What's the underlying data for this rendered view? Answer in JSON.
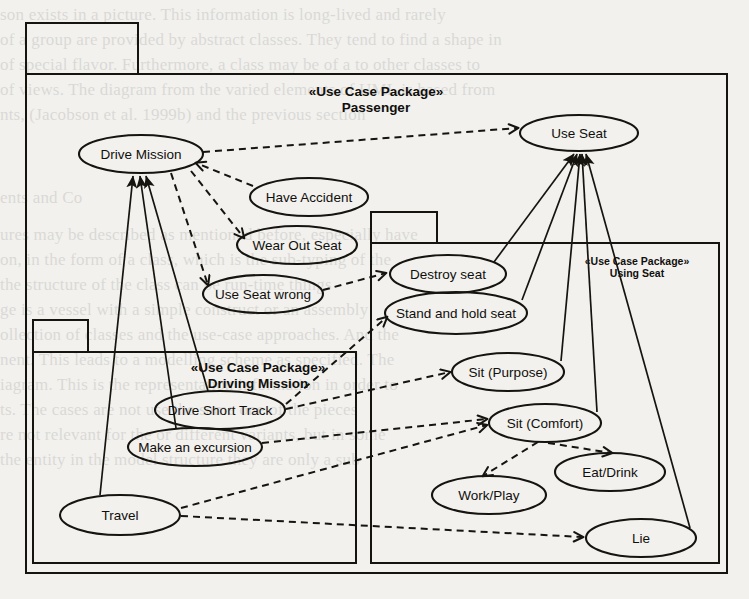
{
  "document": {
    "kind": "uml-use-case-diagram",
    "page_background": "#f2f1ee",
    "ink_color": "#15140f"
  },
  "packages": [
    {
      "id": "passenger",
      "stereotype": "«Use Case Package»",
      "name": "Passenger",
      "label_size": "large",
      "box": {
        "x": 26,
        "y": 74,
        "w": 701,
        "h": 499
      },
      "tab": {
        "x": 26,
        "y": 23,
        "w": 112,
        "h": 51
      },
      "title_x": 376,
      "title_y": 96
    },
    {
      "id": "driving-mission",
      "stereotype": "«Use Case Package»",
      "name": "Driving Mission",
      "label_size": "large",
      "box": {
        "x": 33,
        "y": 352,
        "w": 323,
        "h": 211
      },
      "tab": {
        "x": 33,
        "y": 320,
        "w": 55,
        "h": 32
      },
      "title_x": 258,
      "title_y": 372
    },
    {
      "id": "using-seat",
      "stereotype": "«Use Case Package»",
      "name": "Using Seat",
      "label_size": "small",
      "box": {
        "x": 371,
        "y": 243,
        "w": 348,
        "h": 320
      },
      "tab": {
        "x": 371,
        "y": 212,
        "w": 66,
        "h": 31
      },
      "title_x": 637,
      "title_y": 265
    }
  ],
  "use_cases": [
    {
      "id": "drive-mission",
      "label": "Drive Mission",
      "cx": 141,
      "cy": 154,
      "rx": 62,
      "ry": 19
    },
    {
      "id": "use-seat",
      "label": "Use Seat",
      "cx": 579,
      "cy": 133,
      "rx": 59,
      "ry": 18
    },
    {
      "id": "have-accident",
      "label": "Have Accident",
      "cx": 309,
      "cy": 197,
      "rx": 59,
      "ry": 19
    },
    {
      "id": "wear-out-seat",
      "label": "Wear Out Seat",
      "cx": 297,
      "cy": 245,
      "rx": 60,
      "ry": 19
    },
    {
      "id": "use-seat-wrong",
      "label": "Use Seat wrong",
      "cx": 263,
      "cy": 294,
      "rx": 60,
      "ry": 19
    },
    {
      "id": "destroy-seat",
      "label": "Destroy seat",
      "cx": 448,
      "cy": 274,
      "rx": 58,
      "ry": 19
    },
    {
      "id": "stand-and-hold-seat",
      "label": "Stand and hold seat",
      "cx": 456,
      "cy": 313,
      "rx": 71,
      "ry": 21
    },
    {
      "id": "sit-purpose",
      "label": "Sit (Purpose)",
      "cx": 508,
      "cy": 372,
      "rx": 56,
      "ry": 19
    },
    {
      "id": "sit-comfort",
      "label": "Sit (Comfort)",
      "cx": 545,
      "cy": 423,
      "rx": 56,
      "ry": 19
    },
    {
      "id": "eat-drink",
      "label": "Eat/Drink",
      "cx": 610,
      "cy": 472,
      "rx": 55,
      "ry": 19
    },
    {
      "id": "work-play",
      "label": "Work/Play",
      "cx": 489,
      "cy": 495,
      "rx": 57,
      "ry": 19
    },
    {
      "id": "lie",
      "label": "Lie",
      "cx": 641,
      "cy": 538,
      "rx": 55,
      "ry": 19
    },
    {
      "id": "drive-short-track",
      "label": "Drive Short Track",
      "cx": 220,
      "cy": 410,
      "rx": 65,
      "ry": 19
    },
    {
      "id": "make-an-excursion",
      "label": "Make an excursion",
      "cx": 195,
      "cy": 447,
      "rx": 67,
      "ry": 19
    },
    {
      "id": "travel",
      "label": "Travel",
      "cx": 120,
      "cy": 515,
      "rx": 60,
      "ry": 20
    }
  ],
  "generalizations": [
    {
      "id": "gen-drive-short-track-to-drive-mission",
      "from": "drive-short-track",
      "to": "drive-mission",
      "path": "M 208 391 L 146 176"
    },
    {
      "id": "gen-make-an-excursion-to-drive-mission",
      "from": "make-an-excursion",
      "to": "drive-mission",
      "path": "M 176 428 L 140 176"
    },
    {
      "id": "gen-travel-to-drive-mission",
      "from": "travel",
      "to": "drive-mission",
      "path": "M 100 495 L 133 176"
    },
    {
      "id": "gen-destroy-seat-to-use-seat",
      "from": "destroy-seat",
      "to": "use-seat",
      "path": "M 494 262 L 574 154"
    },
    {
      "id": "gen-stand-and-hold-seat-to-use-seat",
      "from": "stand-and-hold-seat",
      "to": "use-seat",
      "path": "M 522 300 L 577 154"
    },
    {
      "id": "gen-sit-purpose-to-use-seat",
      "from": "sit-purpose",
      "to": "use-seat",
      "path": "M 561 361 L 580 154"
    },
    {
      "id": "gen-sit-comfort-to-use-seat",
      "from": "sit-comfort",
      "to": "use-seat",
      "path": "M 597 412 L 582 154"
    },
    {
      "id": "gen-lie-to-use-seat",
      "from": "lie",
      "to": "use-seat",
      "path": "M 690 528 L 586 154"
    }
  ],
  "dependencies": [
    {
      "id": "dep-drive-mission-to-use-seat",
      "from": "drive-mission",
      "to": "use-seat",
      "path": "M 203 152 L 518 128"
    },
    {
      "id": "dep-have-accident-to-drive-mission",
      "from": "have-accident",
      "to": "drive-mission",
      "path": "M 253 186 L 196 163"
    },
    {
      "id": "dep-drive-mission-to-wear-out-seat",
      "from": "drive-mission",
      "to": "wear-out-seat",
      "path": "M 191 171 L 244 238"
    },
    {
      "id": "dep-drive-mission-to-use-seat-wrong",
      "from": "drive-mission",
      "to": "use-seat-wrong",
      "path": "M 171 173 L 208 285"
    },
    {
      "id": "dep-use-seat-wrong-to-destroy-seat",
      "from": "use-seat-wrong",
      "to": "destroy-seat",
      "path": "M 323 290 L 386 273"
    },
    {
      "id": "dep-drive-short-track-to-stand-hold-seat",
      "from": "drive-short-track",
      "to": "stand-and-hold-seat",
      "path": "M 286 404 L 387 317"
    },
    {
      "id": "dep-drive-short-track-to-sit-purpose",
      "from": "drive-short-track",
      "to": "sit-purpose",
      "path": "M 286 409 L 450 372"
    },
    {
      "id": "dep-make-an-excursion-to-sit-comfort",
      "from": "make-an-excursion",
      "to": "sit-comfort",
      "path": "M 262 443 L 487 419"
    },
    {
      "id": "dep-travel-to-sit-comfort",
      "from": "travel",
      "to": "sit-comfort",
      "path": "M 181 508 L 487 425"
    },
    {
      "id": "dep-travel-to-lie",
      "from": "travel",
      "to": "lie",
      "path": "M 181 516 L 583 537"
    },
    {
      "id": "dep-sit-comfort-to-work-play",
      "from": "sit-comfort",
      "to": "work-play",
      "path": "M 538 442 L 483 476"
    },
    {
      "id": "dep-sit-comfort-to-eat-drink",
      "from": "sit-comfort",
      "to": "eat-drink",
      "path": "M 548 443 L 612 453"
    }
  ],
  "ghost_text": {
    "lines": [
      {
        "x": 0,
        "y": 2,
        "text": "son exists in a picture. This information is long-lived and rarely"
      },
      {
        "x": 0,
        "y": 27,
        "text": "of a group are provided by abstract classes. They tend to find a shape in"
      },
      {
        "x": 0,
        "y": 52,
        "text": "of special flavor. Furthermore, a class may be of a   to other classes to"
      },
      {
        "x": 0,
        "y": 77,
        "text": "of views. The diagram from the varied elements of UML is based from"
      },
      {
        "x": 0,
        "y": 102,
        "text": "nts, (Jacobson et al. 1999b) and the previous section"
      },
      {
        "x": 0,
        "y": 185,
        "text": "ents and Co"
      },
      {
        "x": 0,
        "y": 222,
        "text": "ures may be described as mentioned before, especially have"
      },
      {
        "x": 0,
        "y": 247,
        "text": "on, in the form of a class, which is the sub-typing   of the"
      },
      {
        "x": 0,
        "y": 272,
        "text": "the structure of the class can be run-time things"
      },
      {
        "x": 0,
        "y": 297,
        "text": "ge is a vessel with a simple construct or an assembly"
      },
      {
        "x": 0,
        "y": 322,
        "text": "ollection of classes and the use-case approaches. And the"
      },
      {
        "x": 0,
        "y": 347,
        "text": "nent. This leads to a modelling scheme as specified. The"
      },
      {
        "x": 0,
        "y": 372,
        "text": "iagram. This is the representation information in order to"
      },
      {
        "x": 0,
        "y": 397,
        "text": "ts. The cases are   not use   the same one of the pieces"
      },
      {
        "x": 0,
        "y": 422,
        "text": "re not relevant for the   or different variants, but in some"
      },
      {
        "x": 0,
        "y": 447,
        "text": "the entity   in the model structure   they are only a sub"
      }
    ]
  }
}
